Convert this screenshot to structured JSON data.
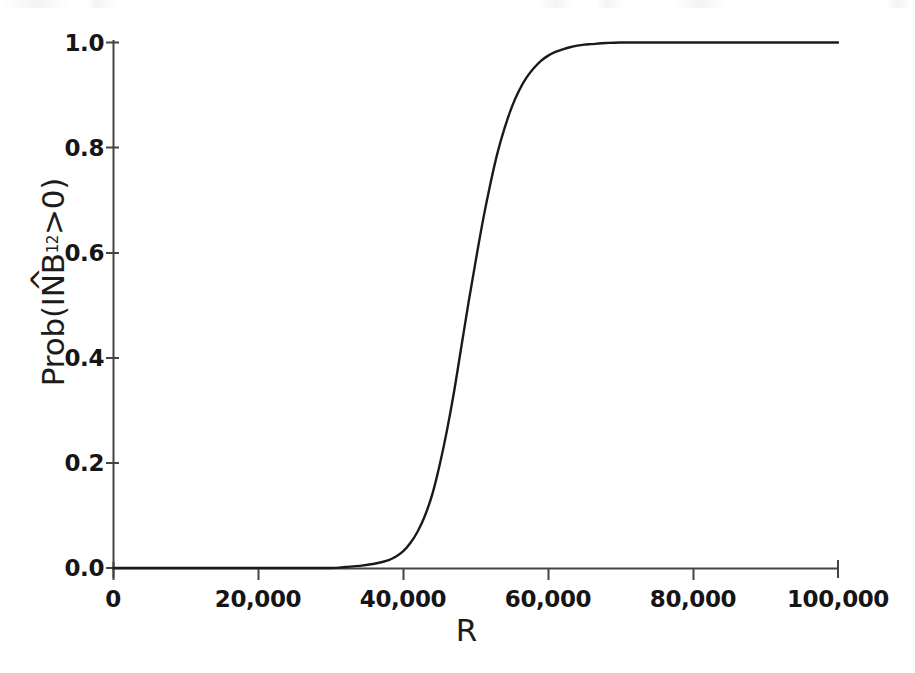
{
  "figure": {
    "name": "cost-effectiveness-acceptability-curve",
    "background_color": "#ffffff",
    "line_color": "#1a1a1a",
    "axis_color": "#3b3b3b"
  },
  "chart_data": {
    "type": "line",
    "title": "",
    "subtitle": "",
    "xlabel": "R",
    "ylabel": "Prob(INB12>0)",
    "ylabel_parts": {
      "prefix": "Prob(",
      "hat_term": "INB",
      "hat_symbol": "^",
      "subscript": "12",
      "suffix": ">0)"
    },
    "xlim": [
      0,
      100000
    ],
    "ylim": [
      0.0,
      1.0
    ],
    "grid": false,
    "legend": null,
    "x_ticks": [
      0,
      20000,
      40000,
      60000,
      80000,
      100000
    ],
    "x_tick_labels": [
      "0",
      "20,000",
      "40,000",
      "60,000",
      "80,000",
      "100,000"
    ],
    "y_ticks": [
      0.0,
      0.2,
      0.4,
      0.6,
      0.8,
      1.0
    ],
    "y_tick_labels": [
      "0.0",
      "0.2",
      "0.4",
      "0.6",
      "0.8",
      "1.0"
    ],
    "series": [
      {
        "name": "Prob(INB12>0)",
        "x": [
          0,
          5000,
          10000,
          15000,
          20000,
          25000,
          30000,
          32000,
          34000,
          36000,
          38000,
          39000,
          40000,
          41000,
          42000,
          43000,
          44000,
          45000,
          46000,
          47000,
          48000,
          49000,
          50000,
          51000,
          52000,
          53000,
          54000,
          55000,
          56000,
          57000,
          58000,
          59000,
          60000,
          61000,
          62000,
          63000,
          64000,
          65000,
          66000,
          68000,
          70000,
          75000,
          80000,
          85000,
          90000,
          95000,
          100000
        ],
        "y": [
          0.0,
          0.0,
          0.0,
          0.0,
          0.0,
          0.0,
          0.0,
          0.002,
          0.004,
          0.008,
          0.015,
          0.022,
          0.032,
          0.048,
          0.07,
          0.1,
          0.14,
          0.195,
          0.26,
          0.335,
          0.42,
          0.505,
          0.585,
          0.662,
          0.73,
          0.79,
          0.838,
          0.878,
          0.909,
          0.933,
          0.951,
          0.965,
          0.975,
          0.982,
          0.987,
          0.991,
          0.994,
          0.996,
          0.997,
          0.999,
          1.0,
          1.0,
          1.0,
          1.0,
          1.0,
          1.0,
          1.0
        ]
      }
    ],
    "annotations": []
  }
}
